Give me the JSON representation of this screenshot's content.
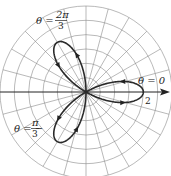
{
  "chart_data": {
    "type": "line",
    "coordinate_system": "polar",
    "title": "",
    "equation": "r = 2cos(3θ)",
    "series": [
      {
        "name": "three-leaved rose",
        "theta_range": [
          0,
          3.14159
        ],
        "function": "2*cos(3*theta)"
      }
    ],
    "r_grid": [
      0.5,
      1,
      1.5,
      2,
      2.5,
      3
    ],
    "angle_grid_step_deg": 15,
    "tick_labels": [
      {
        "text": "2",
        "theta": 0,
        "r": 2
      }
    ],
    "annotations": [
      {
        "text": "θ = 0",
        "theta_label": "0"
      },
      {
        "text": "θ = 2π/3",
        "theta_label": "2π/3"
      },
      {
        "text": "θ = −π/3",
        "theta_label": "−π/3"
      }
    ],
    "grid": true
  },
  "labels": {
    "theta0": "θ = 0",
    "theta_2pi3_num": "2π",
    "theta_2pi3_prefix": "θ =",
    "theta_2pi3_den": "3",
    "theta_mpi3_prefix": "θ = −",
    "theta_mpi3_num": "π",
    "theta_mpi3_den": "3",
    "r_tick": "2"
  }
}
